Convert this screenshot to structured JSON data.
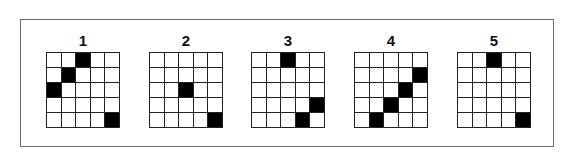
{
  "figure": {
    "grid_size": 5,
    "colors": {
      "filled": "#000000",
      "empty": "#ffffff",
      "lines": "#222222",
      "frame": "#6a6a6a"
    },
    "panels": [
      {
        "label": "1",
        "filled": [
          [
            0,
            2
          ],
          [
            1,
            1
          ],
          [
            2,
            0
          ],
          [
            4,
            4
          ]
        ]
      },
      {
        "label": "2",
        "filled": [
          [
            2,
            2
          ],
          [
            4,
            4
          ]
        ]
      },
      {
        "label": "3",
        "filled": [
          [
            0,
            2
          ],
          [
            3,
            4
          ],
          [
            4,
            3
          ]
        ]
      },
      {
        "label": "4",
        "filled": [
          [
            1,
            4
          ],
          [
            2,
            3
          ],
          [
            3,
            2
          ],
          [
            4,
            1
          ]
        ]
      },
      {
        "label": "5",
        "filled": [
          [
            0,
            2
          ],
          [
            4,
            4
          ]
        ]
      }
    ]
  }
}
